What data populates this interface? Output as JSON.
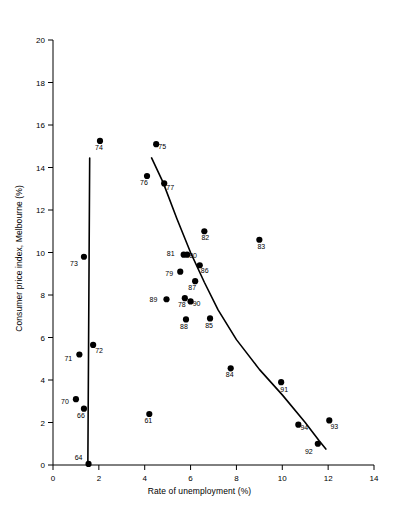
{
  "chart_data": {
    "type": "scatter",
    "title": "",
    "xlabel": "Rate of unemployment (%)",
    "ylabel": "Consumer price index, Melbourne (%)",
    "xlim": [
      0,
      14
    ],
    "ylim": [
      0,
      20
    ],
    "xticks": [
      "0",
      "2",
      "4",
      "6",
      "8",
      "10",
      "12",
      "14"
    ],
    "xtick_values": [
      0,
      2,
      4,
      6,
      8,
      10,
      12,
      14
    ],
    "yticks": [
      "0",
      "2",
      "4",
      "6",
      "8",
      "10",
      "12",
      "14",
      "16",
      "18",
      "20"
    ],
    "ytick_values": [
      0,
      2,
      4,
      6,
      8,
      10,
      12,
      14,
      16,
      18,
      20
    ],
    "grid": false,
    "legend": null,
    "marker": "filled-circle",
    "marker_color": "#000000",
    "line_color": "#000000",
    "points": [
      {
        "label": "64",
        "x": 1.55,
        "y": 0.05,
        "lx": -10,
        "ly": -4
      },
      {
        "label": "66",
        "x": 1.35,
        "y": 2.65,
        "lx": -3,
        "ly": 9
      },
      {
        "label": "61",
        "x": 4.2,
        "y": 2.4,
        "lx": -1,
        "ly": 9
      },
      {
        "label": "70",
        "x": 1.0,
        "y": 3.1,
        "lx": -11,
        "ly": 5
      },
      {
        "label": "71",
        "x": 1.15,
        "y": 5.2,
        "lx": -11,
        "ly": 6
      },
      {
        "label": "72",
        "x": 1.75,
        "y": 5.65,
        "lx": 6,
        "ly": 8
      },
      {
        "label": "73",
        "x": 1.35,
        "y": 9.8,
        "lx": -10,
        "ly": 9
      },
      {
        "label": "74",
        "x": 2.05,
        "y": 15.25,
        "lx": -1,
        "ly": 9
      },
      {
        "label": "75",
        "x": 4.5,
        "y": 15.1,
        "lx": 6,
        "ly": 5
      },
      {
        "label": "76",
        "x": 4.1,
        "y": 13.6,
        "lx": -3,
        "ly": 9
      },
      {
        "label": "77",
        "x": 4.85,
        "y": 13.25,
        "lx": 6,
        "ly": 7
      },
      {
        "label": "78",
        "x": 5.75,
        "y": 7.85,
        "lx": -3,
        "ly": 9
      },
      {
        "label": "79",
        "x": 5.55,
        "y": 9.1,
        "lx": -11,
        "ly": 4
      },
      {
        "label": "80",
        "x": 5.85,
        "y": 9.9,
        "lx": 6,
        "ly": 3
      },
      {
        "label": "81",
        "x": 5.7,
        "y": 9.9,
        "lx": -13,
        "ly": 1
      },
      {
        "label": "82",
        "x": 6.6,
        "y": 11.0,
        "lx": 1,
        "ly": 9
      },
      {
        "label": "83",
        "x": 9.0,
        "y": 10.6,
        "lx": 2,
        "ly": 9
      },
      {
        "label": "84",
        "x": 7.75,
        "y": 4.55,
        "lx": -1,
        "ly": 9
      },
      {
        "label": "85",
        "x": 6.85,
        "y": 6.9,
        "lx": -1,
        "ly": 10
      },
      {
        "label": "86",
        "x": 6.4,
        "y": 9.4,
        "lx": 5,
        "ly": 8
      },
      {
        "label": "87",
        "x": 6.2,
        "y": 8.65,
        "lx": -3,
        "ly": 9
      },
      {
        "label": "88",
        "x": 5.8,
        "y": 6.85,
        "lx": -2,
        "ly": 10
      },
      {
        "label": "89",
        "x": 4.95,
        "y": 7.8,
        "lx": -13,
        "ly": 3
      },
      {
        "label": "90",
        "x": 6.0,
        "y": 7.7,
        "lx": 6,
        "ly": 5
      },
      {
        "label": "91",
        "x": 9.95,
        "y": 3.9,
        "lx": 3,
        "ly": 10
      },
      {
        "label": "92",
        "x": 11.55,
        "y": 1.0,
        "lx": -9,
        "ly": 10
      },
      {
        "label": "93",
        "x": 12.05,
        "y": 2.1,
        "lx": 5,
        "ly": 9
      },
      {
        "label": "94",
        "x": 10.7,
        "y": 1.9,
        "lx": 6,
        "ly": 5
      }
    ],
    "fitted_lines": [
      {
        "name": "vertical-trend-line",
        "points": [
          [
            1.52,
            0.0
          ],
          [
            1.6,
            14.45
          ]
        ]
      },
      {
        "name": "exponential-decay-trend-line",
        "points": [
          [
            4.3,
            14.45
          ],
          [
            4.8,
            13.3
          ],
          [
            5.4,
            11.6
          ],
          [
            6.0,
            10.0
          ],
          [
            6.6,
            8.6
          ],
          [
            7.2,
            7.3
          ],
          [
            8.0,
            5.9
          ],
          [
            9.0,
            4.5
          ],
          [
            10.0,
            3.3
          ],
          [
            11.0,
            2.0
          ],
          [
            11.6,
            1.15
          ],
          [
            11.9,
            0.75
          ]
        ]
      }
    ]
  }
}
